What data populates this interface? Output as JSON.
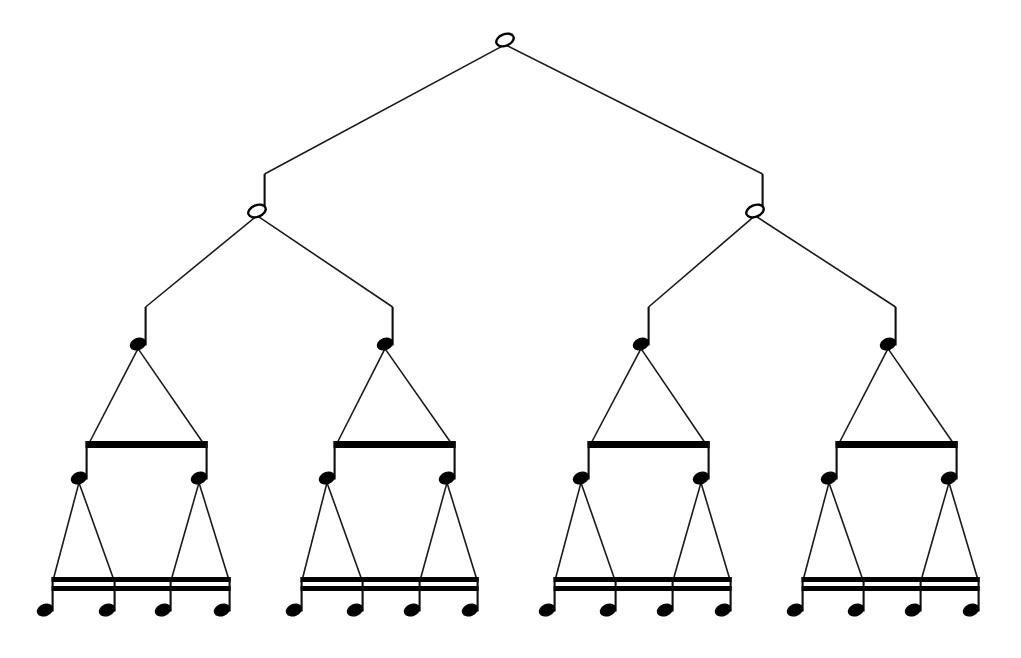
{
  "figure": {
    "background_color": "#ffffff",
    "ink_color": "#000000",
    "width": 1021,
    "height": 658
  },
  "tree": {
    "depth": 5,
    "branching_factor": 2,
    "levels": [
      {
        "index": 0,
        "note_name": "whole-note",
        "note_glyph": "semibreve",
        "head_style": "hollow",
        "has_stem": false,
        "beams": 0,
        "count": 1,
        "y_head": 40,
        "nodes": [
          {
            "id": "n0",
            "x": 505,
            "y": 40
          }
        ]
      },
      {
        "index": 1,
        "note_name": "half-note",
        "note_glyph": "minim",
        "head_style": "hollow",
        "has_stem": true,
        "beams": 0,
        "count": 2,
        "y_head": 211,
        "stem_top": 174,
        "nodes": [
          {
            "id": "n1",
            "x": 257,
            "y": 211
          },
          {
            "id": "n2",
            "x": 755,
            "y": 211
          }
        ]
      },
      {
        "index": 2,
        "note_name": "quarter-note",
        "note_glyph": "crotchet",
        "head_style": "filled",
        "has_stem": true,
        "beams": 0,
        "count": 4,
        "y_head": 344,
        "stem_top": 307,
        "nodes": [
          {
            "id": "n3",
            "x": 138,
            "y": 344
          },
          {
            "id": "n4",
            "x": 385,
            "y": 344
          },
          {
            "id": "n5",
            "x": 641,
            "y": 344
          },
          {
            "id": "n6",
            "x": 888,
            "y": 344
          }
        ]
      },
      {
        "index": 3,
        "note_name": "eighth-note",
        "note_glyph": "quaver",
        "head_style": "filled",
        "has_stem": true,
        "beams": 1,
        "count": 8,
        "y_head": 478,
        "stem_top": 443,
        "beam_y": 441,
        "beam_thickness": 7,
        "nodes": [
          {
            "id": "n7",
            "x": 79,
            "y": 478
          },
          {
            "id": "n8",
            "x": 199,
            "y": 478
          },
          {
            "id": "n9",
            "x": 327,
            "y": 478
          },
          {
            "id": "n10",
            "x": 447,
            "y": 478
          },
          {
            "id": "n11",
            "x": 581,
            "y": 478
          },
          {
            "id": "n12",
            "x": 701,
            "y": 478
          },
          {
            "id": "n13",
            "x": 829,
            "y": 478
          },
          {
            "id": "n14",
            "x": 949,
            "y": 478
          }
        ],
        "beam_groups": [
          {
            "x1": 79,
            "x2": 199
          },
          {
            "x1": 327,
            "x2": 447
          },
          {
            "x1": 581,
            "x2": 701
          },
          {
            "x1": 829,
            "x2": 949
          }
        ]
      },
      {
        "index": 4,
        "note_name": "sixteenth-note",
        "note_glyph": "semiquaver",
        "head_style": "filled",
        "has_stem": true,
        "beams": 2,
        "count": 16,
        "y_head": 610,
        "stem_top": 578,
        "beam_y": 577,
        "beam_thickness": 5,
        "beam_gap": 4,
        "nodes": [
          {
            "id": "n15",
            "x": 45,
            "y": 610
          },
          {
            "id": "n16",
            "x": 107,
            "y": 610
          },
          {
            "id": "n17",
            "x": 163,
            "y": 610
          },
          {
            "id": "n18",
            "x": 222,
            "y": 610
          },
          {
            "id": "n19",
            "x": 294,
            "y": 610
          },
          {
            "id": "n20",
            "x": 355,
            "y": 610
          },
          {
            "id": "n21",
            "x": 412,
            "y": 610
          },
          {
            "id": "n22",
            "x": 470,
            "y": 610
          },
          {
            "id": "n23",
            "x": 547,
            "y": 610
          },
          {
            "id": "n24",
            "x": 608,
            "y": 610
          },
          {
            "id": "n25",
            "x": 665,
            "y": 610
          },
          {
            "id": "n26",
            "x": 723,
            "y": 610
          },
          {
            "id": "n27",
            "x": 795,
            "y": 610
          },
          {
            "id": "n28",
            "x": 856,
            "y": 610
          },
          {
            "id": "n29",
            "x": 913,
            "y": 610
          },
          {
            "id": "n30",
            "x": 971,
            "y": 610
          }
        ],
        "beam_groups": [
          {
            "x1": 45,
            "x2": 222
          },
          {
            "x1": 294,
            "x2": 470
          },
          {
            "x1": 547,
            "x2": 723
          },
          {
            "x1": 795,
            "x2": 971
          }
        ]
      }
    ],
    "edges": [
      {
        "from": "n0",
        "to": "n1"
      },
      {
        "from": "n0",
        "to": "n2"
      },
      {
        "from": "n1",
        "to": "n3"
      },
      {
        "from": "n1",
        "to": "n4"
      },
      {
        "from": "n2",
        "to": "n5"
      },
      {
        "from": "n2",
        "to": "n6"
      },
      {
        "from": "n3",
        "to": "n7"
      },
      {
        "from": "n3",
        "to": "n8"
      },
      {
        "from": "n4",
        "to": "n9"
      },
      {
        "from": "n4",
        "to": "n10"
      },
      {
        "from": "n5",
        "to": "n11"
      },
      {
        "from": "n5",
        "to": "n12"
      },
      {
        "from": "n6",
        "to": "n13"
      },
      {
        "from": "n6",
        "to": "n14"
      },
      {
        "from": "n7",
        "to": "n15"
      },
      {
        "from": "n7",
        "to": "n16"
      },
      {
        "from": "n8",
        "to": "n17"
      },
      {
        "from": "n8",
        "to": "n18"
      },
      {
        "from": "n9",
        "to": "n19"
      },
      {
        "from": "n9",
        "to": "n20"
      },
      {
        "from": "n10",
        "to": "n21"
      },
      {
        "from": "n10",
        "to": "n22"
      },
      {
        "from": "n11",
        "to": "n23"
      },
      {
        "from": "n11",
        "to": "n24"
      },
      {
        "from": "n12",
        "to": "n25"
      },
      {
        "from": "n12",
        "to": "n26"
      },
      {
        "from": "n13",
        "to": "n27"
      },
      {
        "from": "n13",
        "to": "n28"
      },
      {
        "from": "n14",
        "to": "n29"
      },
      {
        "from": "n14",
        "to": "n30"
      }
    ]
  }
}
